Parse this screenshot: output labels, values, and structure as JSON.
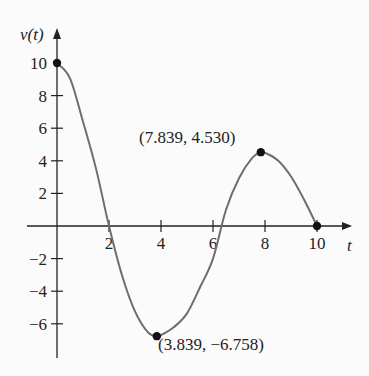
{
  "chart_data": {
    "type": "line",
    "title": "",
    "xlabel": "t",
    "ylabel": "v(t)",
    "xlim": [
      0,
      10
    ],
    "ylim": [
      -7.5,
      11
    ],
    "x_ticks": [
      2,
      4,
      6,
      8,
      10
    ],
    "y_ticks": [
      -6,
      -4,
      -2,
      2,
      4,
      6,
      8,
      10
    ],
    "x_tick_labels": [
      "2",
      "4",
      "6",
      "8",
      "10"
    ],
    "y_tick_labels": [
      "−6",
      "−4",
      "−2",
      "2",
      "4",
      "6",
      "8",
      "10"
    ],
    "grid": false,
    "series": [
      {
        "name": "v(t)",
        "x": [
          0,
          0.5,
          1,
          1.5,
          2,
          2.5,
          3,
          3.5,
          3.839,
          4,
          4.5,
          5,
          5.5,
          6,
          6.5,
          7,
          7.5,
          7.839,
          8,
          8.5,
          9,
          9.5,
          10
        ],
        "y": [
          10,
          9.06,
          6.4,
          3.52,
          0,
          -3.02,
          -5.24,
          -6.53,
          -6.758,
          -6.7,
          -6.2,
          -5.36,
          -3.76,
          -2.0,
          1.0,
          2.93,
          4.16,
          4.53,
          4.49,
          4.02,
          3.04,
          1.63,
          0
        ]
      }
    ],
    "marked_points": [
      {
        "x": 0,
        "y": 10,
        "label": ""
      },
      {
        "x": 3.839,
        "y": -6.758,
        "label": "(3.839, −6.758)"
      },
      {
        "x": 7.839,
        "y": 4.53,
        "label": "(7.839, 4.530)"
      },
      {
        "x": 10,
        "y": 0,
        "label": ""
      }
    ]
  },
  "labels": {
    "y_axis": "v(t)",
    "x_axis": "t",
    "min_point": "(3.839, −6.758)",
    "max_point": "(7.839, 4.530)"
  },
  "colors": {
    "curve": "#6e6e6e",
    "axis": "#222222",
    "point": "#111111"
  }
}
